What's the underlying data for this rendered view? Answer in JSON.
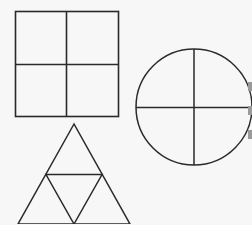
{
  "figure": {
    "stroke_color": "#2a2a2a",
    "background": "#f7f7f7",
    "shapes": [
      {
        "name": "square",
        "divisions": 4,
        "x": 15,
        "y": 11,
        "size": 103
      },
      {
        "name": "circle",
        "divisions": 4,
        "cx": 194,
        "cy": 107,
        "r": 58
      },
      {
        "name": "triangle",
        "divisions": 4,
        "apex": [
          74,
          124
        ],
        "base_left": [
          18,
          224
        ],
        "base_right": [
          130,
          224
        ]
      }
    ]
  }
}
